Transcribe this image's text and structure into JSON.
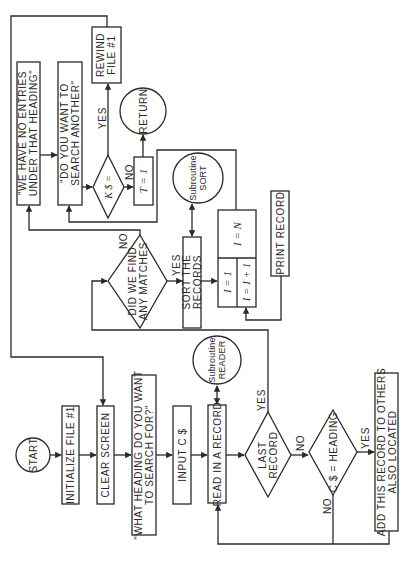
{
  "diagram": {
    "type": "flowchart",
    "orientation": "rotated-90-ccw",
    "nodes": {
      "start": {
        "shape": "circle",
        "label": "START"
      },
      "init_file": {
        "shape": "process",
        "label": "INITIALIZE FILE #1"
      },
      "clear_screen": {
        "shape": "process",
        "label": "CLEAR SCREEN"
      },
      "prompt_heading": {
        "shape": "process",
        "lines": [
          "\"WHAT HEADING DO YOU WANT",
          "TO SEARCH FOR?\""
        ]
      },
      "input_c": {
        "shape": "process",
        "label": "INPUT C $"
      },
      "read_record": {
        "shape": "process",
        "label": "READ IN A RECORD"
      },
      "sub_reader": {
        "shape": "circle",
        "lines": [
          "Subroutine",
          "READER"
        ]
      },
      "last_record": {
        "shape": "decision",
        "lines": [
          "LAST",
          "RECORD"
        ]
      },
      "c_heading": {
        "shape": "decision",
        "label": "C $ = HEADING"
      },
      "add_record": {
        "shape": "process",
        "lines": [
          "ADD THIS RECORD TO OTHERS",
          "ALSO LOCATED"
        ]
      },
      "any_matches": {
        "shape": "decision",
        "lines": [
          "DID WE FIND",
          "ANY MATCHES"
        ]
      },
      "sort_records": {
        "shape": "process",
        "lines": [
          "SORT THE",
          "RECORDS"
        ]
      },
      "sub_sort": {
        "shape": "circle",
        "lines": [
          "Subroutine",
          "SORT"
        ]
      },
      "loop": {
        "shape": "loop",
        "init": "I = 1",
        "increment": "I = I + 1",
        "limit": "I = N"
      },
      "print_record": {
        "shape": "process",
        "label": "PRINT RECORD"
      },
      "no_entries": {
        "shape": "process",
        "lines": [
          "\"WE HAVE NO ENTRIES",
          "UNDER THAT HEADING\""
        ]
      },
      "search_another": {
        "shape": "process",
        "lines": [
          "\"DO YOU WANT TO",
          "SEARCH ANOTHER\""
        ]
      },
      "k_decision": {
        "shape": "decision",
        "label": "K $ ="
      },
      "t_assign": {
        "shape": "process",
        "label": "T = 1"
      },
      "return": {
        "shape": "circle",
        "label": "RETURN"
      },
      "rewind": {
        "shape": "process",
        "lines": [
          "REWIND",
          "FILE #1"
        ]
      }
    },
    "edge_labels": {
      "last_yes": "YES",
      "last_no": "NO",
      "heading_yes": "YES",
      "heading_no": "NO",
      "matches_yes": "YES",
      "matches_no": "NO",
      "k_yes": "YES",
      "k_no": "NO"
    },
    "edges": [
      [
        "start",
        "init_file"
      ],
      [
        "init_file",
        "clear_screen"
      ],
      [
        "clear_screen",
        "prompt_heading"
      ],
      [
        "prompt_heading",
        "input_c"
      ],
      [
        "input_c",
        "read_record"
      ],
      [
        "read_record",
        "last_record"
      ],
      [
        "read_record",
        "sub_reader"
      ],
      [
        "last_record",
        "c_heading",
        "NO"
      ],
      [
        "last_record",
        "any_matches",
        "YES"
      ],
      [
        "c_heading",
        "add_record",
        "YES"
      ],
      [
        "c_heading",
        "read_record",
        "NO"
      ],
      [
        "add_record",
        "read_record"
      ],
      [
        "any_matches",
        "sort_records",
        "YES"
      ],
      [
        "any_matches",
        "no_entries",
        "NO"
      ],
      [
        "sort_records",
        "sub_sort"
      ],
      [
        "sort_records",
        "loop"
      ],
      [
        "loop",
        "print_record"
      ],
      [
        "print_record",
        "loop"
      ],
      [
        "loop",
        "search_another"
      ],
      [
        "no_entries",
        "search_another"
      ],
      [
        "search_another",
        "k_decision"
      ],
      [
        "k_decision",
        "rewind",
        "YES"
      ],
      [
        "k_decision",
        "t_assign",
        "NO"
      ],
      [
        "t_assign",
        "return"
      ],
      [
        "rewind",
        "clear_screen"
      ]
    ],
    "colors": {
      "ink": "#2a2a2a",
      "paper": "#ffffff"
    }
  }
}
